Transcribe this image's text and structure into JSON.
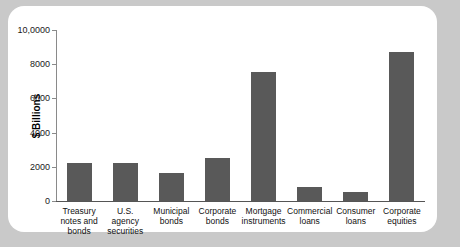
{
  "chart_data": {
    "type": "bar",
    "title": "",
    "xlabel": "",
    "ylabel": "$ Billions",
    "ylim": [
      0,
      10000
    ],
    "grid": false,
    "legend": null,
    "ytick_labels": [
      "0",
      "2000",
      "4000",
      "6000",
      "8000",
      "10,0000"
    ],
    "ytick_values": [
      0,
      2000,
      4000,
      6000,
      8000,
      10000
    ],
    "bar_color": "#595959",
    "categories": [
      "Treasury notes and bonds",
      "U.S. agency securities",
      "Municipal bonds",
      "Corporate bonds",
      "Mortgage instruments",
      "Commercial loans",
      "Consumer loans",
      "Corporate equities"
    ],
    "category_label_lines": [
      [
        "Treasury",
        "notes and",
        "bonds"
      ],
      [
        "U.S. agency",
        "securities"
      ],
      [
        "Municipal",
        "bonds"
      ],
      [
        "Corporate",
        "bonds"
      ],
      [
        "Mortgage",
        "instruments"
      ],
      [
        "Commercial",
        "loans"
      ],
      [
        "Consumer",
        "loans"
      ],
      [
        "Corporate",
        "equities"
      ]
    ],
    "values": [
      2250,
      2200,
      1650,
      2500,
      7550,
      800,
      550,
      8700
    ]
  }
}
